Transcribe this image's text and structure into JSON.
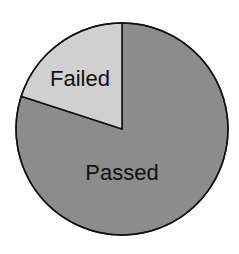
{
  "chart_data": {
    "type": "pie",
    "title": "",
    "categories": [
      "Passed",
      "Failed"
    ],
    "values": [
      80,
      20
    ],
    "colors": [
      "#8c8c8c",
      "#d0d0d0"
    ],
    "start_angle_deg": 0,
    "direction": "clockwise-from-top-passed",
    "legend": "none",
    "labels_inside": true
  },
  "labels": {
    "passed": "Passed",
    "failed": "Failed"
  }
}
